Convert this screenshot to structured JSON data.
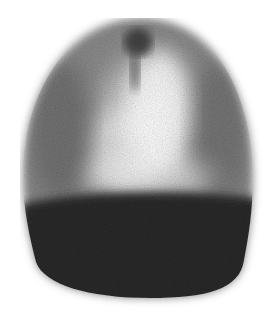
{
  "image": {
    "kind": "grayscale scintigraphy scan",
    "width": 280,
    "height": 318,
    "background": "#ffffff",
    "colors": {
      "dark_base": "#2a2a2a",
      "mid_gray": "#7a7a7a",
      "highlight": "#f4f4f4"
    },
    "regions": [
      {
        "name": "upper-dome",
        "description": "speckled gray dome with bright central area"
      },
      {
        "name": "top-dark-spot",
        "description": "small dark focus at top center"
      },
      {
        "name": "lower-dark-band",
        "description": "dense dark lower region"
      }
    ]
  }
}
